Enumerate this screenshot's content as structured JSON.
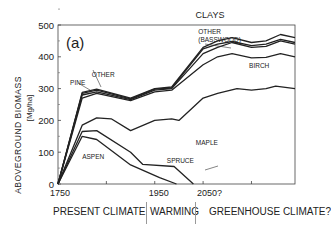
{
  "chart_data": {
    "type": "area",
    "title": "CLAYS",
    "panel_label": "(a)",
    "xlabel": "",
    "ylabel": "ABOVEGROUND BIOMASS",
    "ylabel_units": "[Mg/ha]",
    "xlim": [
      1750,
      2240
    ],
    "ylim": [
      0,
      500
    ],
    "x_ticks": [
      1750,
      1850,
      1950,
      2050,
      2150
    ],
    "x_tick_labels": [
      {
        "x": 1750,
        "label": "1750"
      },
      {
        "x": 1950,
        "label": "1950"
      },
      {
        "x": 2050,
        "label": "2050?"
      }
    ],
    "y_ticks": [
      0,
      100,
      200,
      300,
      400,
      500
    ],
    "grid": false,
    "note": "Stacked cumulative biomass by species; each series is the upper boundary of that species band",
    "series": [
      {
        "name": "ASPEN",
        "points": [
          [
            1750,
            0
          ],
          [
            1800,
            150
          ],
          [
            1830,
            140
          ],
          [
            1900,
            60
          ],
          [
            1960,
            20
          ],
          [
            1995,
            0
          ]
        ]
      },
      {
        "name": "SPRUCE",
        "points": [
          [
            1750,
            0
          ],
          [
            1800,
            165
          ],
          [
            1830,
            168
          ],
          [
            1900,
            100
          ],
          [
            1925,
            62
          ],
          [
            1990,
            55
          ],
          [
            2030,
            0
          ]
        ]
      },
      {
        "name": "MAPLE",
        "points": [
          [
            1750,
            0
          ],
          [
            1800,
            185
          ],
          [
            1830,
            208
          ],
          [
            1860,
            205
          ],
          [
            1900,
            168
          ],
          [
            1950,
            200
          ],
          [
            1985,
            205
          ],
          [
            2000,
            200
          ],
          [
            2050,
            270
          ],
          [
            2080,
            285
          ],
          [
            2120,
            300
          ],
          [
            2150,
            295
          ],
          [
            2180,
            300
          ],
          [
            2200,
            308
          ],
          [
            2240,
            300
          ]
        ]
      },
      {
        "name": "BIRCH",
        "points": [
          [
            1750,
            0
          ],
          [
            1800,
            270
          ],
          [
            1830,
            285
          ],
          [
            1900,
            262
          ],
          [
            1950,
            290
          ],
          [
            1985,
            295
          ],
          [
            2050,
            375
          ],
          [
            2080,
            400
          ],
          [
            2110,
            410
          ],
          [
            2150,
            397
          ],
          [
            2180,
            398
          ],
          [
            2210,
            410
          ],
          [
            2240,
            400
          ]
        ]
      },
      {
        "name": "PINE",
        "points": [
          [
            1750,
            0
          ],
          [
            1800,
            280
          ],
          [
            1830,
            290
          ],
          [
            1900,
            265
          ],
          [
            1950,
            295
          ],
          [
            1985,
            300
          ],
          [
            2050,
            410
          ],
          [
            2080,
            430
          ],
          [
            2110,
            445
          ],
          [
            2150,
            430
          ],
          [
            2180,
            433
          ],
          [
            2210,
            450
          ],
          [
            2240,
            440
          ]
        ]
      },
      {
        "name": "OTHER",
        "points": [
          [
            1750,
            0
          ],
          [
            1800,
            285
          ],
          [
            1830,
            295
          ],
          [
            1900,
            268
          ],
          [
            1950,
            298
          ],
          [
            1985,
            302
          ],
          [
            2050,
            425
          ],
          [
            2080,
            440
          ],
          [
            2110,
            448
          ],
          [
            2150,
            435
          ],
          [
            2180,
            440
          ],
          [
            2210,
            455
          ],
          [
            2240,
            445
          ]
        ]
      },
      {
        "name": "OTHER (BASSWOOD)",
        "points": [
          [
            1750,
            0
          ],
          [
            1800,
            288
          ],
          [
            1830,
            298
          ],
          [
            1900,
            270
          ],
          [
            1950,
            300
          ],
          [
            1985,
            305
          ],
          [
            2050,
            430
          ],
          [
            2080,
            450
          ],
          [
            2110,
            460
          ],
          [
            2150,
            445
          ],
          [
            2180,
            450
          ],
          [
            2210,
            470
          ],
          [
            2240,
            460
          ]
        ]
      }
    ],
    "annotations": [
      {
        "text": "OTHER",
        "x": 1820,
        "y": 338
      },
      {
        "text": "PINE",
        "x": 1775,
        "y": 312
      },
      {
        "text": "OTHER",
        "x": 2040,
        "y": 472
      },
      {
        "text": "(BASSWOOD)",
        "x": 2040,
        "y": 447
      },
      {
        "text": "BIRCH",
        "x": 2145,
        "y": 365
      },
      {
        "text": "MAPLE",
        "x": 2035,
        "y": 123
      },
      {
        "text": "ASPEN",
        "x": 1800,
        "y": 78
      },
      {
        "text": "SPRUCE",
        "x": 1975,
        "y": 65
      }
    ]
  },
  "eras": [
    {
      "label": "PRESENT CLIMATE"
    },
    {
      "label": "WARMING"
    },
    {
      "label": "GREENHOUSE CLIMATE?"
    }
  ]
}
